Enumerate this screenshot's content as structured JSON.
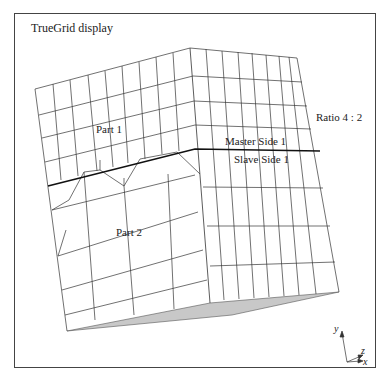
{
  "title": "TrueGrid   display",
  "labels": {
    "part1": "Part   1",
    "part2": "Part   2",
    "master": "Master  Side  1",
    "slave": "Slave  Side  1",
    "ratio": "Ratio  4 : 2"
  },
  "axes": {
    "y": "y",
    "z": "z",
    "x": "x"
  },
  "colors": {
    "line": "#333333",
    "interface": "#111111",
    "bottom_face": "#c8c8c8",
    "frame": "#444444",
    "background": "#ffffff"
  }
}
